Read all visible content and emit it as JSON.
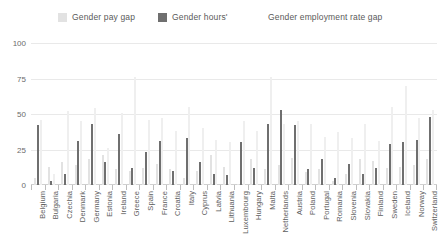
{
  "chart_data": {
    "type": "bar",
    "title": "",
    "xlabel": "",
    "ylabel": "",
    "ylim": [
      0,
      100
    ],
    "yticks": [
      100,
      75,
      50,
      25,
      0
    ],
    "grid": true,
    "legend_position": "top",
    "categories": [
      "Belgium",
      "Bulgaria",
      "Czechia",
      "Denmark",
      "Germany",
      "Estonia",
      "Ireland",
      "Greece",
      "Spain",
      "France",
      "Croatia",
      "Italy",
      "Cyprus",
      "Latvia",
      "Lithuania",
      "Luxembourg",
      "Hungary",
      "Malta",
      "Netherlands",
      "Austria",
      "Poland",
      "Portugal",
      "Romania",
      "Slovenia",
      "Slovakia",
      "Finland",
      "Sweden",
      "Iceland",
      "Norway",
      "Switzerland"
    ],
    "series": [
      {
        "name": "Gender pay gap",
        "color": "#e2e2e2",
        "values": [
          5,
          13,
          16,
          14,
          18,
          21,
          11,
          10,
          12,
          15,
          11,
          5,
          10,
          21,
          13,
          1,
          18,
          11,
          14,
          19,
          9,
          11,
          3,
          8,
          18,
          17,
          12,
          13,
          14,
          18
        ]
      },
      {
        "name": "Gender hours'",
        "color": "#6f6f6f",
        "values": [
          42,
          3,
          8,
          31,
          43,
          16,
          36,
          12,
          23,
          31,
          10,
          33,
          16,
          8,
          7,
          30,
          12,
          43,
          53,
          42,
          11,
          18,
          5,
          15,
          8,
          12,
          29,
          30,
          32,
          48
        ]
      },
      {
        "name": "Gender employment rate gap",
        "color": "#efefef",
        "values": [
          46,
          8,
          52,
          45,
          54,
          26,
          51,
          76,
          46,
          47,
          38,
          55,
          40,
          32,
          30,
          45,
          38,
          76,
          43,
          45,
          43,
          34,
          37,
          33,
          43,
          31,
          55,
          70,
          47,
          53
        ]
      }
    ]
  },
  "legend": {
    "entries": [
      {
        "label": "Gender pay gap",
        "swatch": true
      },
      {
        "label": "Gender hours'",
        "swatch": true
      },
      {
        "label": "Gender employment rate gap",
        "swatch": false
      }
    ]
  },
  "colors": {
    "series_pay_gap": "#e2e2e2",
    "series_hours": "#6f6f6f",
    "series_employment": "#efefef",
    "gridline": "#e9e9e9",
    "text": "#5a5a5a"
  }
}
